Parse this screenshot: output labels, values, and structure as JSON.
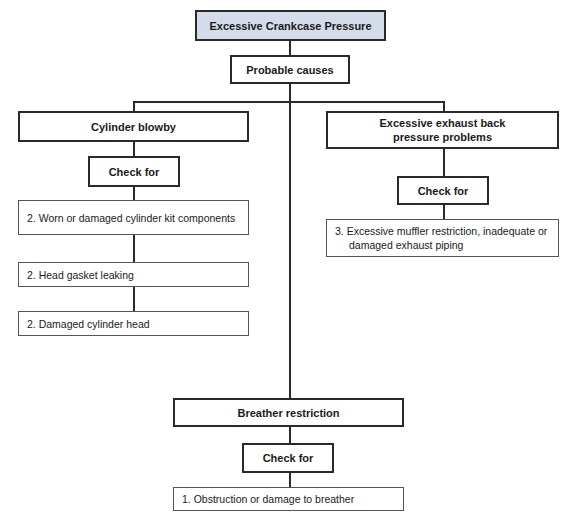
{
  "diagram": {
    "title": "Excessive Crankcase Pressure",
    "probable_causes_label": "Probable causes",
    "branches": [
      {
        "cause": "Cylinder blowby",
        "check_label": "Check for",
        "items": [
          "2. Worn or damaged cylinder kit components",
          "2. Head gasket leaking",
          "2. Damaged cylinder head"
        ]
      },
      {
        "cause": "Excessive exhaust back pressure problems",
        "check_label": "Check for",
        "items": [
          "3. Excessive muffler restriction, inadequate or damaged exhaust piping"
        ]
      },
      {
        "cause": "Breather restriction",
        "check_label": "Check for",
        "items": [
          "1. Obstruction or damage to breather"
        ]
      }
    ],
    "colors": {
      "title_fill": "#d4dcea",
      "line": "#2a2a2a"
    }
  }
}
